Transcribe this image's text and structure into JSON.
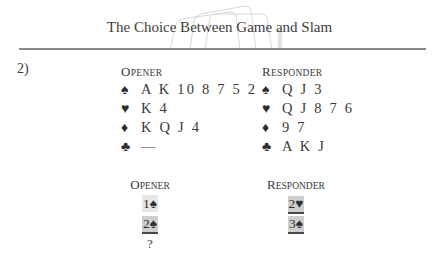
{
  "header": {
    "title": "The Choice Between Game and Slam"
  },
  "problem": {
    "number": "2)",
    "hands": {
      "opener": {
        "label_first": "O",
        "label_rest": "PENER",
        "suits": [
          {
            "symbol": "♠",
            "name": "spades",
            "cards": "A K 10 8 7 5 2"
          },
          {
            "symbol": "♥",
            "name": "hearts",
            "cards": "K 4"
          },
          {
            "symbol": "♦",
            "name": "diamonds",
            "cards": "K Q J 4"
          },
          {
            "symbol": "♣",
            "name": "clubs",
            "cards": "—"
          }
        ]
      },
      "responder": {
        "label_first": "R",
        "label_rest": "ESPONDER",
        "suits": [
          {
            "symbol": "♠",
            "name": "spades",
            "cards": "Q J 3"
          },
          {
            "symbol": "♥",
            "name": "hearts",
            "cards": "Q J 8 7 6"
          },
          {
            "symbol": "♦",
            "name": "diamonds",
            "cards": "9 7"
          },
          {
            "symbol": "♣",
            "name": "clubs",
            "cards": "A K J"
          }
        ]
      }
    },
    "auction": {
      "opener": {
        "label_first": "O",
        "label_rest": "PENER",
        "bids": [
          "1♠",
          "2♠",
          "?"
        ]
      },
      "responder": {
        "label_first": "R",
        "label_rest": "ESPONDER",
        "bids": [
          "2♥",
          "3♠"
        ]
      }
    }
  }
}
